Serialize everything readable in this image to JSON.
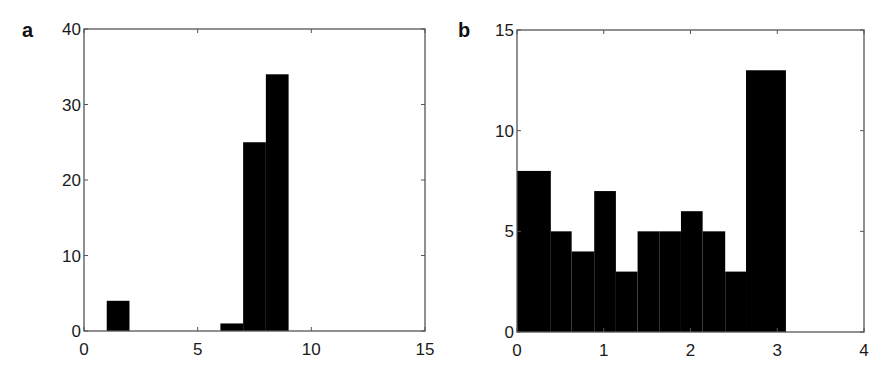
{
  "chart_data": [
    {
      "panel": "a",
      "type": "bar",
      "subtype": "histogram",
      "title": "",
      "xlabel": "",
      "ylabel": "",
      "xlim": [
        0,
        15
      ],
      "ylim": [
        0,
        40
      ],
      "xticks": [
        0,
        5,
        10,
        15
      ],
      "yticks": [
        0,
        10,
        20,
        30,
        40
      ],
      "grid": false,
      "legend": null,
      "bar_color": "#000000",
      "bins": [
        {
          "x0": 1,
          "x1": 2,
          "count": 4
        },
        {
          "x0": 6,
          "x1": 7,
          "count": 1
        },
        {
          "x0": 7,
          "x1": 8,
          "count": 25
        },
        {
          "x0": 8,
          "x1": 9,
          "count": 34
        }
      ]
    },
    {
      "panel": "b",
      "type": "bar",
      "subtype": "histogram",
      "title": "",
      "xlabel": "",
      "ylabel": "",
      "xlim": [
        0,
        4
      ],
      "ylim": [
        0,
        15
      ],
      "xticks": [
        0,
        1,
        2,
        3,
        4
      ],
      "yticks": [
        0,
        5,
        10,
        15
      ],
      "grid": false,
      "legend": null,
      "bar_color": "#000000",
      "bins": [
        {
          "x0": 0.0,
          "x1": 0.39,
          "count": 8
        },
        {
          "x0": 0.39,
          "x1": 0.63,
          "count": 5
        },
        {
          "x0": 0.63,
          "x1": 0.89,
          "count": 4
        },
        {
          "x0": 0.89,
          "x1": 1.14,
          "count": 7
        },
        {
          "x0": 1.14,
          "x1": 1.39,
          "count": 3
        },
        {
          "x0": 1.39,
          "x1": 1.64,
          "count": 5
        },
        {
          "x0": 1.64,
          "x1": 1.89,
          "count": 5
        },
        {
          "x0": 1.89,
          "x1": 2.14,
          "count": 6
        },
        {
          "x0": 2.14,
          "x1": 2.4,
          "count": 5
        },
        {
          "x0": 2.4,
          "x1": 2.64,
          "count": 3
        },
        {
          "x0": 2.64,
          "x1": 3.1,
          "count": 13
        }
      ]
    }
  ],
  "panels": {
    "a": {
      "letter": "a",
      "box": {
        "left": 84,
        "top": 29,
        "right": 425,
        "bottom": 331
      }
    },
    "b": {
      "letter": "b",
      "box": {
        "left": 517,
        "top": 30,
        "right": 864,
        "bottom": 332
      }
    }
  }
}
